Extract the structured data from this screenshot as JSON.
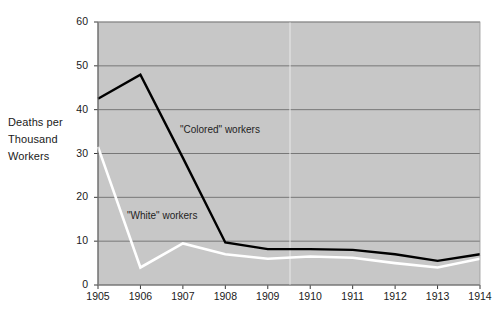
{
  "chart_data": {
    "type": "line",
    "title": "",
    "subtitle": "",
    "xlabel": "",
    "ylabel": "Deaths per Thousand Workers",
    "ylabel_lines": [
      "Deaths per",
      "Thousand",
      "Workers"
    ],
    "categories": [
      "1905",
      "1906",
      "1907",
      "1908",
      "1909",
      "1910",
      "1911",
      "1912",
      "1913",
      "1914"
    ],
    "x": [
      1905,
      1906,
      1907,
      1908,
      1909,
      1910,
      1911,
      1912,
      1913,
      1914
    ],
    "xlim": [
      1905,
      1914
    ],
    "ylim": [
      0,
      60
    ],
    "yticks": [
      0,
      10,
      20,
      30,
      40,
      50,
      60
    ],
    "ytick_labels": [
      "0",
      "10",
      "20",
      "30",
      "40",
      "50",
      "60"
    ],
    "grid": true,
    "grid_axis": "y",
    "legend_position": "inline-annotations",
    "plot_background": "#c7c7c7",
    "series": [
      {
        "name": "\"Colored\" workers",
        "color": "#000000",
        "label_text": "\"Colored\" workers",
        "values": [
          42.5,
          48.0,
          29.0,
          9.7,
          8.2,
          8.2,
          8.0,
          7.0,
          5.5,
          7.0
        ]
      },
      {
        "name": "\"White\" workers",
        "color": "#ffffff",
        "label_text": "\"White\" workers",
        "values": [
          31.5,
          4.0,
          9.5,
          7.0,
          6.0,
          6.5,
          6.2,
          5.0,
          4.0,
          6.0
        ]
      }
    ],
    "annotations": [
      {
        "text": "\"Colored\" workers",
        "x": 1908.2,
        "y": 33.5
      },
      {
        "text": "\"White\" workers",
        "x": 1906.9,
        "y": 12.6
      }
    ]
  }
}
